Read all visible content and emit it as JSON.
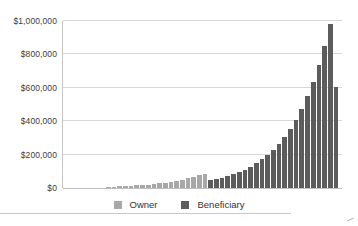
{
  "chart_data": {
    "type": "bar",
    "title": "",
    "xlabel": "",
    "ylabel": "",
    "ylim": [
      0,
      1000000
    ],
    "grid": true,
    "legend_position": "bottom",
    "y_axis_ticks": [
      {
        "label": "$0",
        "value": 0
      },
      {
        "label": "$200,000",
        "value": 200000
      },
      {
        "label": "$400,000",
        "value": 400000
      },
      {
        "label": "$600,000",
        "value": 600000
      },
      {
        "label": "$800,000",
        "value": 800000
      },
      {
        "label": "$1,000,000",
        "value": 1000000
      }
    ],
    "series": [
      {
        "name": "Owner",
        "color": "#a8a8a8",
        "values": [
          8000,
          9000,
          10000,
          12000,
          14000,
          16000,
          18000,
          21000,
          24000,
          28000,
          32000,
          37000,
          43000,
          49000,
          57000,
          65000,
          75000,
          86000
        ]
      },
      {
        "name": "Beneficiary",
        "color": "#5c5c5c",
        "values": [
          46000,
          53000,
          62000,
          71000,
          82000,
          95000,
          110000,
          128000,
          148000,
          171000,
          198000,
          229000,
          265000,
          306000,
          354000,
          410000,
          474000,
          549000,
          635000,
          734000,
          850000,
          983000,
          607000
        ]
      }
    ]
  }
}
